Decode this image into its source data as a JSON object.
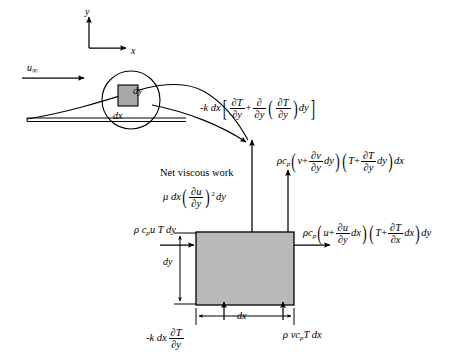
{
  "figure": {
    "background_color": "#ffffff",
    "line_color": "#000000",
    "control_volume_fill": "#b9b9b9",
    "inset_square_fill": "#a8a8a8"
  },
  "axes": {
    "y_label": "y",
    "x_label": "x"
  },
  "freestream": {
    "label_base": "u",
    "label_sub": "∞"
  },
  "inset": {
    "dy_label": "dy",
    "dx_label": "dx"
  },
  "control_volume": {
    "dy_label": "dy",
    "dx_label": "dx"
  },
  "terms": {
    "conduction_top": {
      "name": "conduction-out-top",
      "plain": "-k dx [ ∂T/∂y + ∂/∂y ( ∂T/∂y ) dy ]",
      "lead": "-k dx",
      "frac1_num": "∂T",
      "frac1_den": "∂y",
      "operator": "+",
      "frac2_num": "∂",
      "frac2_den": "∂y",
      "frac3_num": "∂T",
      "frac3_den": "∂y",
      "trail": "dy"
    },
    "viscous_work": {
      "name": "net-viscous-work",
      "title": "Net viscous work",
      "plain": "μ dx ( ∂u/∂y )² dy",
      "lead": "μ dx",
      "frac_num": "∂u",
      "frac_den": "∂y",
      "exponent": "2",
      "trail": "dy"
    },
    "convection_top": {
      "name": "convection-out-top",
      "plain": "ρc_p ( v + ∂v/∂y dy )( T + ∂T/∂y dy ) dx",
      "lead": "ρc",
      "lead_sub": "p",
      "g1_first": "v",
      "g1_op": "+",
      "g1_num": "∂v",
      "g1_den": "∂y",
      "g1_trail": "dy",
      "g2_first": "T",
      "g2_op": "+",
      "g2_num": "∂T",
      "g2_den": "∂y",
      "g2_trail": "dy",
      "trail": "dx"
    },
    "convection_right": {
      "name": "convection-out-right",
      "plain": "ρc_p ( u + ∂u/∂y dx )( T + ∂T/∂x dx ) dy",
      "lead": "ρc",
      "lead_sub": "p",
      "g1_first": "u",
      "g1_op": "+",
      "g1_num": "∂u",
      "g1_den": "∂y",
      "g1_trail": "dx",
      "g2_first": "T",
      "g2_op": "+",
      "g2_num": "∂T",
      "g2_den": "∂x",
      "g2_trail": "dx",
      "trail": "dy"
    },
    "convection_left": {
      "name": "convection-in-left",
      "plain": "ρ c_p u T dy",
      "lead": "ρ c",
      "lead_sub": "p",
      "trail": "u T dy"
    },
    "conduction_bottom": {
      "name": "conduction-in-bottom",
      "plain": "-k dx ∂T/∂y",
      "lead": "-k dx",
      "frac_num": "∂T",
      "frac_den": "∂y"
    },
    "convection_bottom": {
      "name": "convection-in-bottom",
      "plain": "ρ v c_p T dx",
      "lead": "ρ vc",
      "lead_sub": "p",
      "trail": "T dx"
    }
  }
}
